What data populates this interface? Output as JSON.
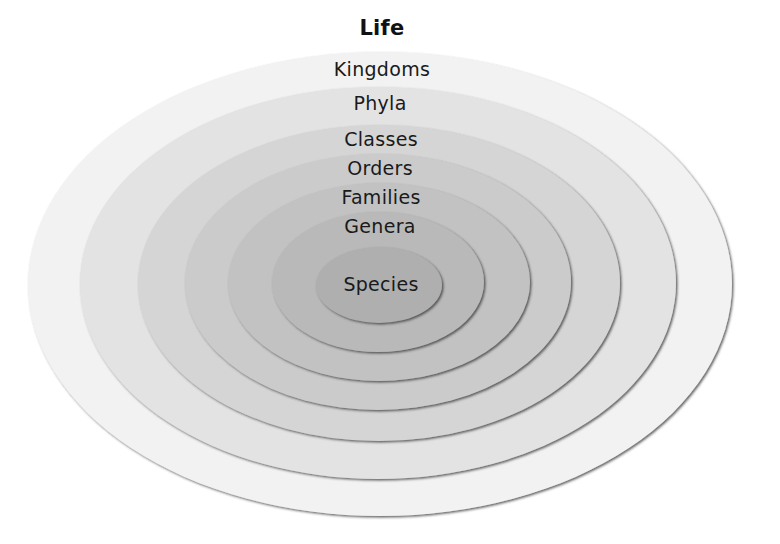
{
  "title": "Life",
  "levels": [
    {
      "label": "Kingdoms",
      "color": "#f2f2f2",
      "cx": 380,
      "cy": 284,
      "rx": 352,
      "ry": 232,
      "label_y": 58
    },
    {
      "label": "Phyla",
      "color": "#e3e3e3",
      "cx": 378,
      "cy": 283,
      "rx": 298,
      "ry": 196,
      "label_y": 92
    },
    {
      "label": "Classes",
      "color": "#d5d5d5",
      "cx": 379,
      "cy": 283,
      "rx": 241,
      "ry": 158,
      "label_y": 128
    },
    {
      "label": "Orders",
      "color": "#cbcbcb",
      "cx": 378,
      "cy": 282,
      "rx": 193,
      "ry": 128,
      "label_y": 157
    },
    {
      "label": "Families",
      "color": "#c2c2c2",
      "cx": 379,
      "cy": 282,
      "rx": 151,
      "ry": 99,
      "label_y": 186
    },
    {
      "label": "Genera",
      "color": "#b9b9b9",
      "cx": 378,
      "cy": 282,
      "rx": 106,
      "ry": 70,
      "label_y": 215
    },
    {
      "label": "Species",
      "color": "#afafaf",
      "cx": 379,
      "cy": 285,
      "rx": 63,
      "ry": 38,
      "label_y": 273
    }
  ],
  "edge_color": "#555555"
}
